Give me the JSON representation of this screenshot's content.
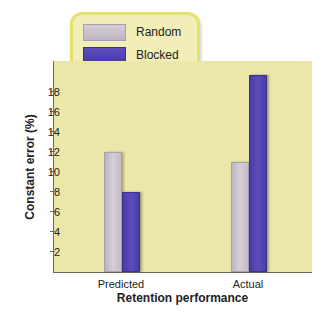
{
  "chart_data": {
    "type": "bar",
    "title": "",
    "xlabel": "Retention performance",
    "ylabel": "Constant error (%)",
    "categories": [
      "Predicted",
      "Actual"
    ],
    "series": [
      {
        "name": "Random",
        "values": [
          12,
          11
        ],
        "color": "#c9c1cb"
      },
      {
        "name": "Blocked",
        "values": [
          8,
          19.7
        ],
        "color": "#5547b0"
      }
    ],
    "yticks": [
      2,
      4,
      6,
      8,
      10,
      12,
      14,
      16,
      18
    ],
    "ylim": [
      0,
      21
    ],
    "grid": false,
    "legend_position": "top-left, above plot"
  },
  "legend": {
    "items": [
      {
        "label": "Random"
      },
      {
        "label": "Blocked"
      }
    ]
  },
  "axes": {
    "xlabel": "Retention performance",
    "ylabel": "Constant error (%)",
    "yticks": [
      "2",
      "4",
      "6",
      "8",
      "10",
      "12",
      "14",
      "16",
      "18"
    ],
    "categories": [
      "Predicted",
      "Actual"
    ]
  },
  "colors": {
    "plot_background": "#ebe7a8",
    "legend_background": "#f1eeb8",
    "legend_border": "#e6e06e",
    "random": "#c9c1cb",
    "blocked": "#5547b0"
  }
}
